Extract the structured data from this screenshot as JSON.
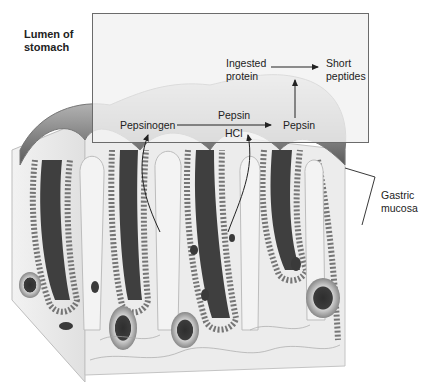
{
  "labels": {
    "lumen": [
      "Lumen of",
      "stomach"
    ],
    "ingested": [
      "Ingested",
      "protein"
    ],
    "short": [
      "Short",
      "peptides"
    ],
    "pepsinogen": "Pepsinogen",
    "pepsin_catalyst": "Pepsin",
    "hcl": "HCl",
    "pepsin_product": "Pepsin",
    "gastric": [
      "Gastric",
      "mucosa"
    ]
  },
  "colors": {
    "box_fill": "#f1f1f1",
    "box_stroke": "#6b6b6b",
    "tissue_dark": "#4a4a4a",
    "tissue_mid": "#9a9a9a",
    "tissue_light": "#e8e8e8",
    "arrow": "#222222"
  }
}
